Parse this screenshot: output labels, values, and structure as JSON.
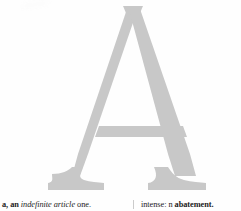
{
  "page": {
    "background_color": "#fefefe",
    "width": 241,
    "height": 211
  },
  "dropcap": {
    "letter": "A",
    "style": "serif-capital",
    "color": "#c6c6c6",
    "description": "large light gray serif capital letter A"
  },
  "artifact": {
    "name": "scan-smudge",
    "color": "#fcfcfc"
  },
  "entries": {
    "left_column": {
      "headword": "a, an",
      "part_of_speech": "indefinite article",
      "definition": "one."
    },
    "right_column": {
      "lead_fragment": "intense:",
      "part_of_speech": "n",
      "headword": "abatement."
    }
  },
  "divider": {
    "name": "column-rule",
    "color": "#b9b9b9"
  }
}
